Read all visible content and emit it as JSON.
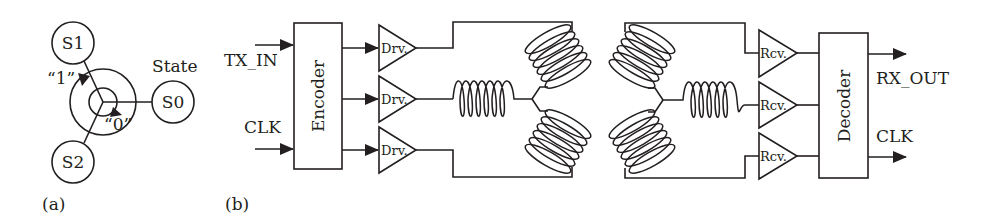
{
  "figure_a": {
    "label": "(a)",
    "states": [
      {
        "id": "S0",
        "label": "S0",
        "cx": 173,
        "cy": 102
      },
      {
        "id": "S1",
        "label": "S1",
        "cx": 73,
        "cy": 43
      },
      {
        "id": "S2",
        "label": "S2",
        "cx": 73,
        "cy": 162
      }
    ],
    "state_title": "State",
    "transition_labels": {
      "one": "“1”",
      "zero": "“0”"
    }
  },
  "figure_b": {
    "label": "(b)",
    "inputs": {
      "tx_in": "TX_IN",
      "clk": "CLK"
    },
    "encoder_label": "Encoder",
    "drivers": [
      "Drv.",
      "Drv.",
      "Drv."
    ],
    "receivers": [
      "Rcv.",
      "Rcv.",
      "Rcv."
    ],
    "decoder_label": "Decoder",
    "outputs": {
      "rx_out": "RX_OUT",
      "clk": "CLK"
    }
  },
  "colors": {
    "stroke": "#231f20",
    "background": "#ffffff"
  }
}
